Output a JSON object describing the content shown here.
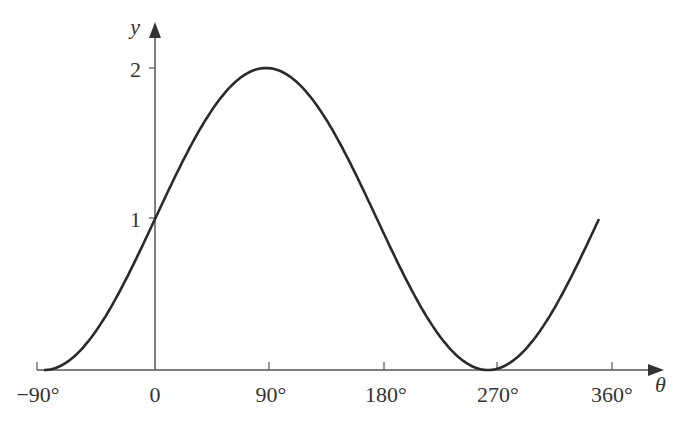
{
  "chart_data": {
    "type": "line",
    "title": "",
    "function": "y = 1 + sin θ",
    "xlabel": "θ",
    "ylabel": "y",
    "x_ticks": [
      "−90°",
      "0",
      "90°",
      "180°",
      "270°",
      "360°"
    ],
    "y_ticks": [
      "1",
      "2"
    ],
    "xlim": [
      -90,
      360
    ],
    "ylim": [
      0,
      2
    ],
    "grid": false,
    "series": [
      {
        "name": "y = 1 + sin θ",
        "x": [
          -90,
          -45,
          0,
          45,
          90,
          135,
          180,
          225,
          270,
          315,
          360
        ],
        "values": [
          0,
          0.29,
          1,
          1.71,
          2,
          1.71,
          1,
          0.29,
          0,
          0.29,
          1
        ]
      }
    ],
    "colors": {
      "curve": "#2a2a2a",
      "axes": "#555555",
      "text": "#333333"
    }
  }
}
